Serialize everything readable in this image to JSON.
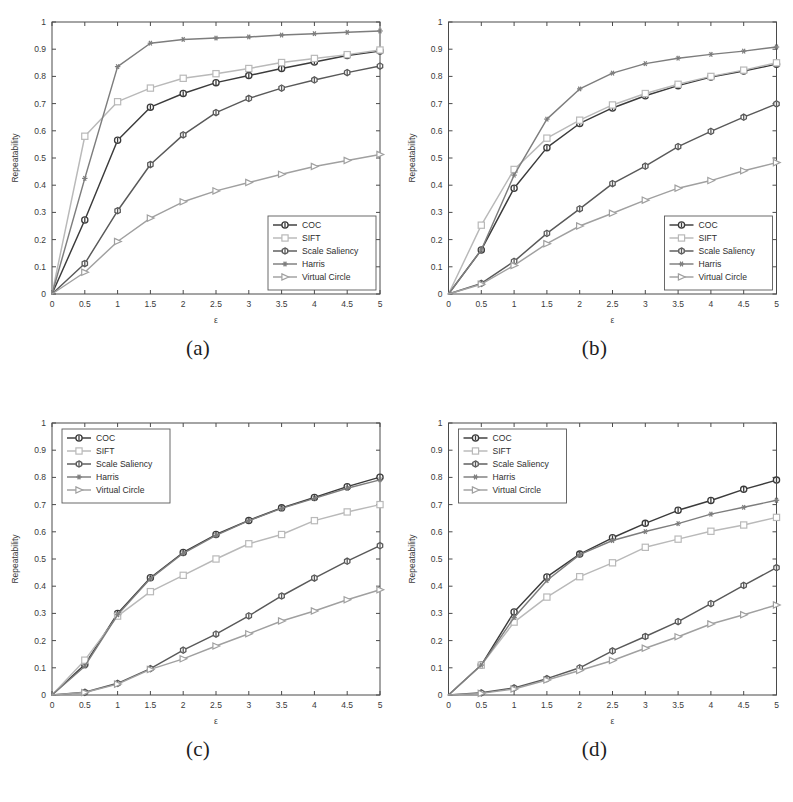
{
  "figure": {
    "panels": [
      {
        "id": "a",
        "caption": "(a)",
        "legend_position": "bottom-right"
      },
      {
        "id": "b",
        "caption": "(b)",
        "legend_position": "bottom-right"
      },
      {
        "id": "c",
        "caption": "(c)",
        "legend_position": "top-left"
      },
      {
        "id": "d",
        "caption": "(d)",
        "legend_position": "top-left"
      }
    ]
  },
  "series_style": {
    "COC": {
      "color": "#3b3b3b",
      "marker": "circle"
    },
    "SIFT": {
      "color": "#b9b9b9",
      "marker": "square"
    },
    "Scale Saliency": {
      "color": "#595959",
      "marker": "hexagon"
    },
    "Harris": {
      "color": "#7d7d7d",
      "marker": "star"
    },
    "Virtual Circle": {
      "color": "#a0a0a0",
      "marker": "triangle-right"
    }
  },
  "chart_data": [
    {
      "type": "line",
      "panel": "a",
      "title": "",
      "xlabel": "ε",
      "ylabel": "Repeatability",
      "xlim": [
        0,
        5
      ],
      "ylim": [
        0,
        1
      ],
      "xticks": [
        0,
        0.5,
        1,
        1.5,
        2,
        2.5,
        3,
        3.5,
        4,
        4.5,
        5
      ],
      "xticklabels": [
        "0",
        "0.5",
        "1",
        "1.5",
        "2",
        "2.5",
        "3",
        "3.5",
        "4",
        "4.5",
        "5"
      ],
      "yticks": [
        0,
        0.1,
        0.2,
        0.3,
        0.4,
        0.5,
        0.6,
        0.7,
        0.8,
        0.9,
        1
      ],
      "yticklabels": [
        "0",
        "0.1",
        "0.2",
        "0.3",
        "0.4",
        "0.5",
        "0.6",
        "0.7",
        "0.8",
        "0.9",
        "1"
      ],
      "grid": false,
      "legend": [
        "COC",
        "SIFT",
        "Scale Saliency",
        "Harris",
        "Virtual Circle"
      ],
      "legend_position": "bottom-right",
      "x": [
        0,
        0.5,
        1,
        1.5,
        2,
        2.5,
        3,
        3.5,
        4,
        4.5,
        5
      ],
      "series": [
        {
          "name": "COC",
          "values": [
            0,
            0.272,
            0.565,
            0.687,
            0.737,
            0.777,
            0.803,
            0.829,
            0.853,
            0.877,
            0.893
          ]
        },
        {
          "name": "SIFT",
          "values": [
            0,
            0.58,
            0.707,
            0.757,
            0.793,
            0.81,
            0.829,
            0.851,
            0.866,
            0.88,
            0.897
          ]
        },
        {
          "name": "Scale Saliency",
          "values": [
            0,
            0.112,
            0.306,
            0.476,
            0.585,
            0.667,
            0.719,
            0.757,
            0.787,
            0.814,
            0.838
          ]
        },
        {
          "name": "Harris",
          "values": [
            0,
            0.425,
            0.836,
            0.922,
            0.936,
            0.941,
            0.945,
            0.952,
            0.957,
            0.962,
            0.967
          ]
        },
        {
          "name": "Virtual Circle",
          "values": [
            0,
            0.08,
            0.193,
            0.279,
            0.339,
            0.379,
            0.41,
            0.44,
            0.469,
            0.491,
            0.513
          ]
        }
      ]
    },
    {
      "type": "line",
      "panel": "b",
      "title": "",
      "xlabel": "ε",
      "ylabel": "Repeatability",
      "xlim": [
        0,
        5
      ],
      "ylim": [
        0,
        1
      ],
      "xticks": [
        0,
        0.5,
        1,
        1.5,
        2,
        2.5,
        3,
        3.5,
        4,
        4.5,
        5
      ],
      "xticklabels": [
        "0",
        "0.5",
        "1",
        "1.5",
        "2",
        "2.5",
        "3",
        "3.5",
        "4",
        "4.5",
        "5"
      ],
      "yticks": [
        0,
        0.1,
        0.2,
        0.3,
        0.4,
        0.5,
        0.6,
        0.7,
        0.8,
        0.9,
        1
      ],
      "yticklabels": [
        "0",
        "0.1",
        "0.2",
        "0.3",
        "0.4",
        "0.5",
        "0.6",
        "0.7",
        "0.8",
        "0.9",
        "1"
      ],
      "grid": false,
      "legend": [
        "COC",
        "SIFT",
        "Scale Saliency",
        "Harris",
        "Virtual Circle"
      ],
      "legend_position": "bottom-right",
      "x": [
        0,
        0.5,
        1,
        1.5,
        2,
        2.5,
        3,
        3.5,
        4,
        4.5,
        5
      ],
      "series": [
        {
          "name": "COC",
          "values": [
            0,
            0.162,
            0.389,
            0.538,
            0.627,
            0.684,
            0.729,
            0.766,
            0.798,
            0.82,
            0.845
          ]
        },
        {
          "name": "SIFT",
          "values": [
            0,
            0.253,
            0.458,
            0.573,
            0.639,
            0.695,
            0.737,
            0.771,
            0.8,
            0.823,
            0.85
          ]
        },
        {
          "name": "Scale Saliency",
          "values": [
            0,
            0.039,
            0.12,
            0.223,
            0.313,
            0.406,
            0.47,
            0.542,
            0.598,
            0.65,
            0.699
          ]
        },
        {
          "name": "Harris",
          "values": [
            0,
            0.162,
            0.437,
            0.643,
            0.754,
            0.812,
            0.847,
            0.867,
            0.881,
            0.893,
            0.908
          ]
        },
        {
          "name": "Virtual Circle",
          "values": [
            0,
            0.036,
            0.105,
            0.185,
            0.25,
            0.297,
            0.345,
            0.389,
            0.417,
            0.453,
            0.483
          ]
        }
      ]
    },
    {
      "type": "line",
      "panel": "c",
      "title": "",
      "xlabel": "ε",
      "ylabel": "Repeatability",
      "xlim": [
        0,
        5
      ],
      "ylim": [
        0,
        1
      ],
      "xticks": [
        0,
        0.5,
        1,
        1.5,
        2,
        2.5,
        3,
        3.5,
        4,
        4.5,
        5
      ],
      "xticklabels": [
        "0",
        "0.5",
        "1",
        "1.5",
        "2",
        "2.5",
        "3",
        "3.5",
        "4",
        "4.5",
        "5"
      ],
      "yticks": [
        0,
        0.1,
        0.2,
        0.3,
        0.4,
        0.5,
        0.6,
        0.7,
        0.8,
        0.9,
        1
      ],
      "yticklabels": [
        "0",
        "0.1",
        "0.2",
        "0.3",
        "0.4",
        "0.5",
        "0.6",
        "0.7",
        "0.8",
        "0.9",
        "1"
      ],
      "grid": false,
      "legend": [
        "COC",
        "SIFT",
        "Scale Saliency",
        "Harris",
        "Virtual Circle"
      ],
      "legend_position": "top-left",
      "x": [
        0,
        0.5,
        1,
        1.5,
        2,
        2.5,
        3,
        3.5,
        4,
        4.5,
        5
      ],
      "series": [
        {
          "name": "COC",
          "values": [
            0,
            0.112,
            0.3,
            0.431,
            0.524,
            0.59,
            0.642,
            0.688,
            0.726,
            0.766,
            0.801
          ]
        },
        {
          "name": "SIFT",
          "values": [
            0,
            0.128,
            0.29,
            0.38,
            0.44,
            0.5,
            0.556,
            0.59,
            0.641,
            0.673,
            0.7
          ]
        },
        {
          "name": "Scale Saliency",
          "values": [
            0,
            0.01,
            0.043,
            0.097,
            0.165,
            0.224,
            0.291,
            0.364,
            0.43,
            0.492,
            0.549
          ]
        },
        {
          "name": "Harris",
          "values": [
            0,
            0.106,
            0.295,
            0.428,
            0.521,
            0.587,
            0.641,
            0.686,
            0.723,
            0.76,
            0.791
          ]
        },
        {
          "name": "Virtual Circle",
          "values": [
            0,
            0.009,
            0.04,
            0.094,
            0.133,
            0.18,
            0.225,
            0.272,
            0.309,
            0.35,
            0.387
          ]
        }
      ]
    },
    {
      "type": "line",
      "panel": "d",
      "title": "",
      "xlabel": "ε",
      "ylabel": "Repeatability",
      "xlim": [
        0,
        5
      ],
      "ylim": [
        0,
        1
      ],
      "xticks": [
        0,
        0.5,
        1,
        1.5,
        2,
        2.5,
        3,
        3.5,
        4,
        4.5,
        5
      ],
      "xticklabels": [
        "0",
        "0.5",
        "1",
        "1.5",
        "2",
        "2.5",
        "3",
        "3.5",
        "4",
        "4.5",
        "5"
      ],
      "yticks": [
        0,
        0.1,
        0.2,
        0.3,
        0.4,
        0.5,
        0.6,
        0.7,
        0.8,
        0.9,
        1
      ],
      "yticklabels": [
        "0",
        "0.1",
        "0.2",
        "0.3",
        "0.4",
        "0.5",
        "0.6",
        "0.7",
        "0.8",
        "0.9",
        "1"
      ],
      "grid": false,
      "legend": [
        "COC",
        "SIFT",
        "Scale Saliency",
        "Harris",
        "Virtual Circle"
      ],
      "legend_position": "top-left",
      "x": [
        0,
        0.5,
        1,
        1.5,
        2,
        2.5,
        3,
        3.5,
        4,
        4.5,
        5
      ],
      "series": [
        {
          "name": "COC",
          "values": [
            0,
            0.11,
            0.305,
            0.434,
            0.518,
            0.578,
            0.631,
            0.679,
            0.715,
            0.756,
            0.79
          ]
        },
        {
          "name": "SIFT",
          "values": [
            0,
            0.11,
            0.268,
            0.36,
            0.435,
            0.486,
            0.543,
            0.573,
            0.602,
            0.625,
            0.653
          ]
        },
        {
          "name": "Scale Saliency",
          "values": [
            0,
            0.008,
            0.026,
            0.06,
            0.1,
            0.162,
            0.215,
            0.27,
            0.336,
            0.403,
            0.468
          ]
        },
        {
          "name": "Harris",
          "values": [
            0,
            0.11,
            0.285,
            0.421,
            0.516,
            0.568,
            0.601,
            0.63,
            0.665,
            0.69,
            0.716
          ]
        },
        {
          "name": "Virtual Circle",
          "values": [
            0,
            0.006,
            0.022,
            0.055,
            0.09,
            0.127,
            0.172,
            0.214,
            0.261,
            0.295,
            0.331
          ]
        }
      ]
    }
  ]
}
